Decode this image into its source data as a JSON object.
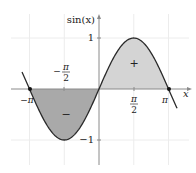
{
  "chart_data": {
    "type": "area",
    "title": "",
    "function": "sin(x)",
    "xlabel": "x",
    "ylabel": "sin(x)",
    "xlim": [
      -3.48,
      3.53
    ],
    "ylim": [
      -1.5,
      1.5
    ],
    "grid": true,
    "legend": null,
    "x_ticks": [
      {
        "value": -3.14159,
        "label": "−π"
      },
      {
        "value": -1.5708,
        "label": "−π/2",
        "num": "π",
        "den": "2",
        "sign": "−"
      },
      {
        "value": 1.5708,
        "label": "π/2",
        "num": "π",
        "den": "2",
        "sign": ""
      },
      {
        "value": 3.14159,
        "label": "π"
      }
    ],
    "y_ticks": [
      {
        "value": 1,
        "label": "1"
      },
      {
        "value": -1,
        "label": "−1"
      }
    ],
    "series": [
      {
        "name": "sin(x)",
        "x": [
          -3.48,
          -3.14159,
          -2.356,
          -1.5708,
          -0.785,
          0,
          0.785,
          1.5708,
          2.356,
          3.14159,
          3.53
        ],
        "values": [
          0.33,
          0,
          -0.707,
          -1,
          -0.707,
          0,
          0.707,
          1,
          0.707,
          0,
          -0.38
        ]
      }
    ],
    "shaded_regions": [
      {
        "from": -3.14159,
        "to": 0,
        "sign_label": "−",
        "color": "#a9a9a9"
      },
      {
        "from": 0,
        "to": 3.14159,
        "sign_label": "+",
        "color": "#d4d4d4"
      }
    ],
    "marked_points": [
      {
        "x": -3.14159,
        "y": 0
      },
      {
        "x": 3.14159,
        "y": 0
      }
    ],
    "colors": {
      "curve": "#2a2a2a",
      "axis": "#8a8a8a",
      "grid": "#ececec",
      "negative_fill": "#a9a9a9",
      "positive_fill": "#d4d4d4"
    }
  },
  "labels": {
    "y_axis": "sin(x)",
    "x_axis": "x",
    "y_one": "1",
    "y_neg_one": "−1",
    "x_neg_pi": "−π",
    "x_pi": "π",
    "x_half_pi_num": "π",
    "x_half_pi_den": "2",
    "x_neg_half_pi_sign": "−",
    "x_neg_half_pi_num": "π",
    "x_neg_half_pi_den": "2",
    "positive_sign": "+",
    "negative_sign": "−"
  }
}
